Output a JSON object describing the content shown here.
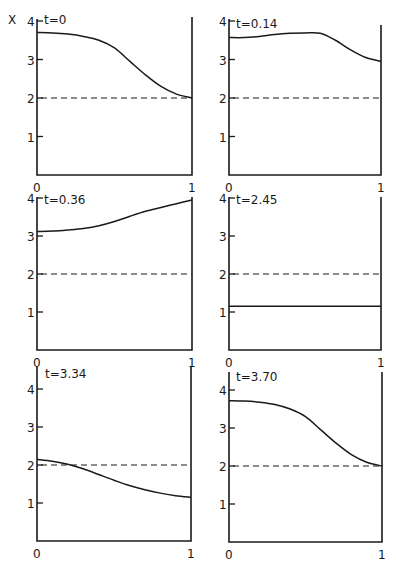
{
  "chart_data": {
    "type": "line",
    "title": "",
    "ylabel": "X",
    "xlabel": "",
    "layout": "3x2 grid of small multiples",
    "grid": false,
    "legend": null,
    "xlim": [
      0,
      1
    ],
    "ylim": [
      0,
      4
    ],
    "x_ticks": [
      "0",
      "1"
    ],
    "y_ticks": [
      "1",
      "2",
      "3",
      "4"
    ],
    "reference_line": {
      "y": 2,
      "style": "dashed"
    },
    "panels": [
      {
        "label": "t=0",
        "x": [
          0,
          0.1,
          0.2,
          0.3,
          0.4,
          0.5,
          0.6,
          0.7,
          0.8,
          0.9,
          1.0
        ],
        "y": [
          3.7,
          3.69,
          3.66,
          3.6,
          3.5,
          3.3,
          2.95,
          2.6,
          2.3,
          2.1,
          2.0
        ]
      },
      {
        "label": "t=0.14",
        "x": [
          0,
          0.1,
          0.2,
          0.3,
          0.4,
          0.5,
          0.6,
          0.7,
          0.8,
          0.9,
          1.0
        ],
        "y": [
          3.57,
          3.57,
          3.6,
          3.65,
          3.68,
          3.69,
          3.68,
          3.5,
          3.25,
          3.05,
          2.95
        ]
      },
      {
        "label": "t=0.36",
        "x": [
          0,
          0.1,
          0.2,
          0.3,
          0.4,
          0.5,
          0.6,
          0.7,
          0.8,
          0.9,
          1.0
        ],
        "y": [
          3.12,
          3.13,
          3.16,
          3.2,
          3.27,
          3.38,
          3.52,
          3.65,
          3.75,
          3.85,
          3.95
        ]
      },
      {
        "label": "t=2.45",
        "x": [
          0,
          1.0
        ],
        "y": [
          1.15,
          1.15
        ]
      },
      {
        "label": "t=3.34",
        "x": [
          0,
          0.1,
          0.2,
          0.3,
          0.4,
          0.5,
          0.6,
          0.7,
          0.8,
          0.9,
          1.0
        ],
        "y": [
          2.15,
          2.1,
          2.02,
          1.9,
          1.75,
          1.6,
          1.46,
          1.35,
          1.26,
          1.19,
          1.15
        ]
      },
      {
        "label": "t=3.70",
        "x": [
          0,
          0.1,
          0.2,
          0.3,
          0.4,
          0.5,
          0.6,
          0.7,
          0.8,
          0.9,
          1.0
        ],
        "y": [
          3.72,
          3.71,
          3.68,
          3.62,
          3.5,
          3.3,
          2.95,
          2.6,
          2.3,
          2.1,
          2.0
        ]
      }
    ]
  },
  "figure": {
    "y_axis_symbol": "X",
    "panel_labels": [
      "t=0",
      "t=0.14",
      "t=0.36",
      "t=2.45",
      "t=3.34",
      "t=3.70"
    ],
    "x_tick_labels": [
      "0",
      "1"
    ],
    "y_tick_labels": [
      "1",
      "2",
      "3",
      "4"
    ]
  }
}
